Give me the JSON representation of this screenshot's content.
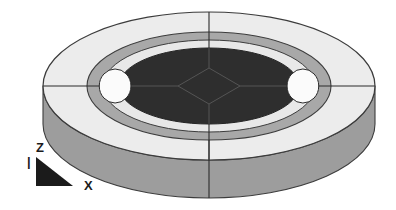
{
  "figure": {
    "canvas": {
      "width": 396,
      "height": 210,
      "background": "#ffffff"
    },
    "geometry": {
      "center_x": 209,
      "center_y": 86,
      "outer_rx": 166,
      "outer_ry": 74,
      "mid_rx": 122,
      "mid_ry": 54,
      "inner_rx": 106,
      "inner_ry": 46,
      "core_rx": 90,
      "core_ry": 38,
      "extrusion_depth": 38,
      "notch_rx": 22,
      "notch_ry": 17,
      "diamond_rx": 31,
      "diamond_ry": 18
    },
    "colors": {
      "outer_top_face": "#ececec",
      "mid_ring_face": "#a8a8a8",
      "inner_core_face": "#2e2e2e",
      "outer_side_wall": "#9d9d9d",
      "mid_side_wall": "#b4b4b4",
      "outline": "#3c3c3c",
      "mesh_line": "#2b2b2b",
      "core_mesh_line": "#555555",
      "background": "#ffffff",
      "axis_glyph": "#1b1b1b"
    },
    "radial_lines": [
      {
        "name": "radial-line-top",
        "angle_deg": 270
      },
      {
        "name": "radial-line-bottom",
        "angle_deg": 90
      },
      {
        "name": "radial-line-left",
        "angle_deg": 180
      },
      {
        "name": "radial-line-right",
        "angle_deg": 0
      }
    ]
  },
  "axis_indicator": {
    "name": "axis-triad",
    "z_label": "Z",
    "x_label": "X",
    "z_tick": "|",
    "triangle": {
      "apex_x": 36,
      "apex_y": 157,
      "base_left_x": 36,
      "base_left_y": 186,
      "base_right_x": 73,
      "base_right_y": 186,
      "fill": "#1b1b1b"
    },
    "z_label_pos": {
      "x": 36,
      "y": 152
    },
    "x_label_pos": {
      "x": 84,
      "y": 190
    },
    "z_tick_pos": {
      "x": 27,
      "y": 166
    }
  }
}
